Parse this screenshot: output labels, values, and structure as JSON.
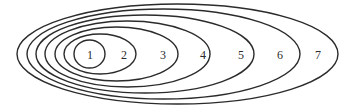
{
  "diagram": {
    "type": "nested-ellipses",
    "stroke_color": "#2b2b2b",
    "background": "#ffffff",
    "ellipses": [
      {
        "label": "1",
        "left": 74,
        "right": 105,
        "top": 40,
        "bottom": 68,
        "label_x": 90
      },
      {
        "label": "2",
        "left": 64,
        "right": 136,
        "top": 34,
        "bottom": 74,
        "label_x": 124
      },
      {
        "label": "3",
        "left": 55,
        "right": 178,
        "top": 27,
        "bottom": 81,
        "label_x": 163
      },
      {
        "label": "4",
        "left": 45,
        "right": 210,
        "top": 21,
        "bottom": 87,
        "label_x": 203
      },
      {
        "label": "5",
        "left": 36,
        "right": 254,
        "top": 15,
        "bottom": 93,
        "label_x": 241
      },
      {
        "label": "6",
        "left": 27,
        "right": 300,
        "top": 9,
        "bottom": 99,
        "label_x": 280
      },
      {
        "label": "7",
        "left": 17,
        "right": 338,
        "top": 4,
        "bottom": 104,
        "label_x": 318
      }
    ],
    "label_y": 55
  }
}
